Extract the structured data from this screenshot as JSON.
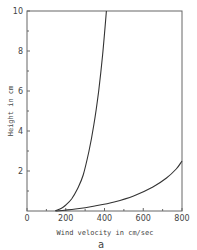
{
  "chart_data": {
    "type": "line",
    "title": "",
    "panel_label": "a",
    "xlabel": "Wind velocity in cm/sec",
    "ylabel": "Height in cm",
    "xlim": [
      0,
      800
    ],
    "ylim": [
      0,
      10
    ],
    "x_ticks": [
      0,
      200,
      400,
      600,
      800
    ],
    "x_minor_ticks": [
      100,
      300,
      500,
      700
    ],
    "y_ticks": [
      2,
      4,
      6,
      8,
      10
    ],
    "y_minor_ticks": [
      1,
      3,
      5,
      7,
      9
    ],
    "grid": false,
    "legend": null,
    "series": [
      {
        "name": "steep profile",
        "x": [
          145,
          180,
          200,
          230,
          260,
          290,
          320,
          345,
          370,
          390,
          410
        ],
        "y": [
          0,
          0.15,
          0.3,
          0.6,
          1.1,
          1.8,
          3.0,
          4.3,
          6.0,
          7.8,
          10
        ]
      },
      {
        "name": "shallow profile",
        "x": [
          150,
          250,
          350,
          450,
          550,
          650,
          720,
          770,
          800
        ],
        "y": [
          0,
          0.1,
          0.25,
          0.45,
          0.75,
          1.2,
          1.65,
          2.1,
          2.5
        ]
      }
    ]
  }
}
